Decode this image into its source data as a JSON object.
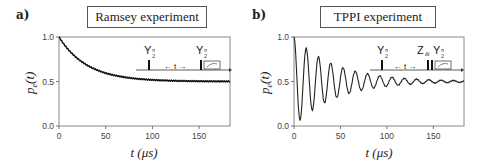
{
  "panels": [
    {
      "letter": "a)",
      "title": "Ramsey experiment",
      "inset": {
        "pulse1": "Y",
        "pulse1_sub": "π/2",
        "pulse2": "Y",
        "pulse2_sub": "π/2",
        "delay": "← t →"
      }
    },
    {
      "letter": "b)",
      "title": "TPPI experiment",
      "inset": {
        "pulse1": "Y",
        "pulse1_sub": "π/2",
        "pulse2a": "Z",
        "pulse2a_sub": "δt",
        "pulse2": "Y",
        "pulse2_sub": "π/2",
        "delay": "← t →"
      }
    }
  ],
  "axes": {
    "ylabel": "pe(t)",
    "xlabel": "t (μs)",
    "yticks": [
      "0.0",
      "0.5",
      "1.0"
    ],
    "xticks": [
      "0",
      "50",
      "100",
      "150"
    ]
  },
  "chart_data": [
    {
      "type": "line",
      "title": "Ramsey experiment",
      "panel": "a)",
      "xlabel": "t (μs)",
      "ylabel": "p_e(t)",
      "xlim": [
        0,
        183
      ],
      "ylim": [
        0,
        1.0
      ],
      "xticks": [
        0,
        50,
        100,
        150
      ],
      "yticks": [
        0.0,
        0.5,
        1.0
      ],
      "grid": false,
      "model": "0.5 + 0.5*exp(-t/30)",
      "x": [
        0,
        10,
        20,
        30,
        40,
        50,
        60,
        70,
        80,
        90,
        100,
        120,
        140,
        160,
        183
      ],
      "values": [
        1.0,
        0.86,
        0.76,
        0.68,
        0.63,
        0.59,
        0.56,
        0.54,
        0.53,
        0.52,
        0.51,
        0.505,
        0.5,
        0.5,
        0.5
      ]
    },
    {
      "type": "line",
      "title": "TPPI experiment",
      "panel": "b)",
      "xlabel": "t (μs)",
      "ylabel": "p_e(t)",
      "xlim": [
        0,
        183
      ],
      "ylim": [
        0,
        1.0
      ],
      "xticks": [
        0,
        50,
        100,
        150
      ],
      "yticks": [
        0.0,
        0.5,
        1.0
      ],
      "grid": false,
      "model": "0.5 + 0.5*exp(-t/45)*cos(2π t/13.2)",
      "period_us": 13.2,
      "decay_us": 45,
      "x": [
        0,
        6.6,
        13.2,
        19.8,
        26.4,
        33,
        39.6,
        46.2,
        52.8,
        66,
        79.2,
        92.4,
        118.8,
        158.4,
        183
      ],
      "values": [
        1.0,
        0.06,
        0.87,
        0.18,
        0.78,
        0.26,
        0.71,
        0.32,
        0.65,
        0.61,
        0.58,
        0.56,
        0.53,
        0.51,
        0.5
      ]
    }
  ]
}
